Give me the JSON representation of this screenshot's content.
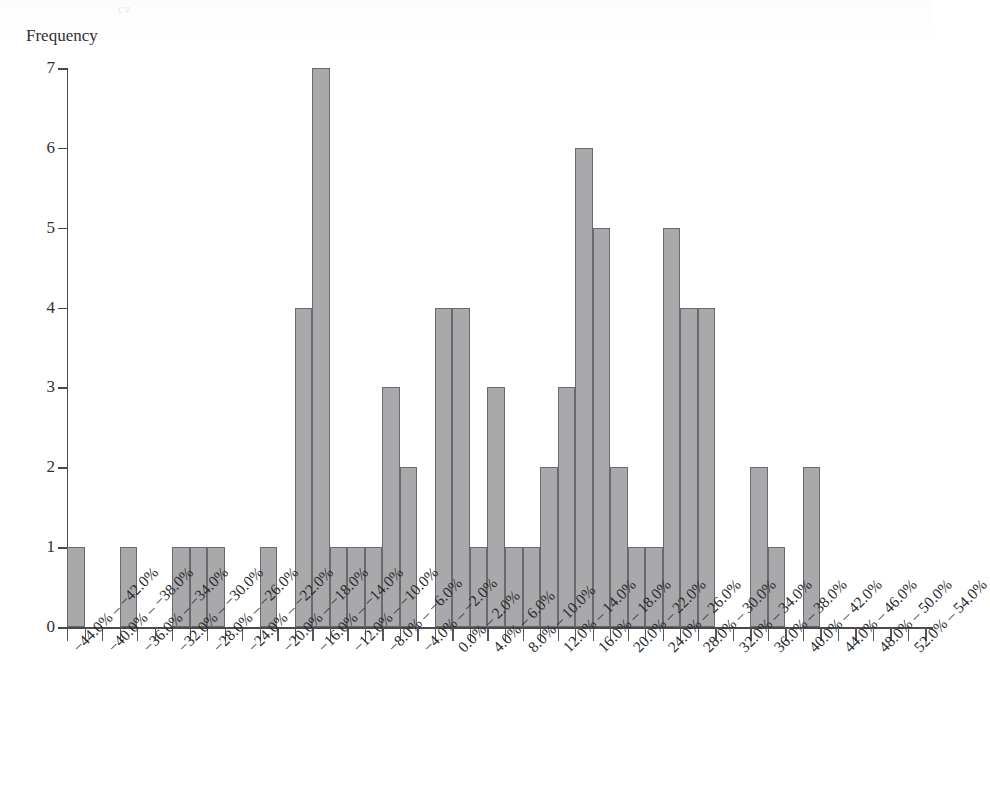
{
  "figure": {
    "faint_cropped_title": "cv",
    "y_axis_title": "Frequency",
    "x_axis_title": ""
  },
  "chart_data": {
    "type": "bar",
    "title": "",
    "subtitle": "",
    "xlabel": "",
    "ylabel": "Frequency",
    "ylim": [
      0,
      7
    ],
    "y_ticks": [
      0,
      1,
      2,
      3,
      4,
      5,
      6,
      7
    ],
    "grid": false,
    "legend": null,
    "bin_width_percent": 2.0,
    "bar_fill_color": "#a9a9ab",
    "bar_edge_color": "#6a6a6e",
    "axis_color": "#4a4a4a",
    "categories": [
      "−44.0% – −42.0%",
      "−42.0% – −40.0%",
      "−40.0% – −38.0%",
      "−38.0% – −36.0%",
      "−36.0% – −34.0%",
      "−34.0% – −32.0%",
      "−32.0% – −30.0%",
      "−30.0% – −28.0%",
      "−28.0% – −26.0%",
      "−26.0% – −24.0%",
      "−24.0% – −22.0%",
      "−22.0% – −20.0%",
      "−20.0% – −18.0%",
      "−18.0% – −16.0%",
      "−16.0% – −14.0%",
      "−14.0% – −12.0%",
      "−12.0% – −10.0%",
      "−10.0% – −8.0%",
      "−8.0% – −6.0%",
      "−6.0% – −4.0%",
      "−4.0% – −2.0%",
      "−2.0% – 0.0%",
      "0.0% – 2.0%",
      "2.0% – 4.0%",
      "4.0% – 6.0%",
      "6.0% – 8.0%",
      "8.0% – 10.0%",
      "10.0% – 12.0%",
      "12.0% – 14.0%",
      "14.0% – 16.0%",
      "16.0% – 18.0%",
      "18.0% – 20.0%",
      "20.0% – 22.0%",
      "22.0% – 24.0%",
      "24.0% – 26.0%",
      "26.0% – 28.0%",
      "28.0% – 30.0%",
      "30.0% – 32.0%",
      "32.0% – 34.0%",
      "34.0% – 36.0%",
      "36.0% – 38.0%",
      "38.0% – 40.0%",
      "40.0% – 42.0%",
      "42.0% – 44.0%",
      "44.0% – 46.0%",
      "46.0% – 48.0%",
      "48.0% – 50.0%",
      "50.0% – 52.0%",
      "52.0% – 54.0%"
    ],
    "values": [
      1,
      0,
      0,
      1,
      0,
      0,
      1,
      1,
      1,
      0,
      0,
      1,
      0,
      4,
      7,
      1,
      1,
      1,
      3,
      2,
      0,
      4,
      4,
      1,
      3,
      1,
      1,
      2,
      3,
      6,
      5,
      2,
      1,
      1,
      5,
      4,
      4,
      0,
      0,
      2,
      1,
      0,
      2,
      0,
      0,
      0,
      0,
      0,
      0
    ],
    "tick_labels_shown": [
      "−44.0% – −42.0%",
      "−40.0% – −38.0%",
      "−36.0% – −34.0%",
      "−32.0% – −30.0%",
      "−28.0% – −26.0%",
      "−24.0% – −22.0%",
      "−20.0% – −18.0%",
      "−16.0% – −14.0%",
      "−12.0% – −10.0%",
      "−8.0% – −6.0%",
      "−4.0% – −2.0%",
      "0.0% – 2.0%",
      "4.0% – 6.0%",
      "8.0% – 10.0%",
      "12.0% – 14.0%",
      "16.0% – 18.0%",
      "20.0% – 22.0%",
      "24.0% – 26.0%",
      "28.0% – 30.0%",
      "32.0% – 34.0%",
      "36.0% – 38.0%",
      "40.0% – 42.0%",
      "44.0% – 46.0%",
      "48.0% – 50.0%",
      "52.0% – 54.0%"
    ]
  }
}
